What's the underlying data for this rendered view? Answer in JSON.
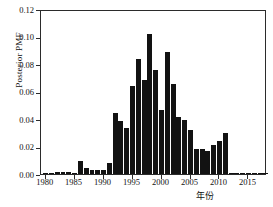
{
  "chart_data": {
    "type": "bar",
    "title": "",
    "xlabel": "年份",
    "ylabel": "Posterior PMF",
    "ylim": [
      0.0,
      0.12
    ],
    "xlim": [
      1979.2,
      2018.2
    ],
    "grid": false,
    "legend": null,
    "bar_color": "#121212",
    "background_color": "#ffffff",
    "axis_color": "#2b2b2b",
    "ytick_labels": [
      "0.00",
      "0.02",
      "0.04",
      "0.06",
      "0.08",
      "0.10",
      "0.12"
    ],
    "ytick_values": [
      0.0,
      0.02,
      0.04,
      0.06,
      0.08,
      0.1,
      0.12
    ],
    "xtick_labels": [
      "1980",
      "1985",
      "1990",
      "1995",
      "2000",
      "2005",
      "2010",
      "2015"
    ],
    "xtick_values": [
      1980,
      1985,
      1990,
      1995,
      2000,
      2005,
      2010,
      2015
    ],
    "categories": [
      1980,
      1981,
      1982,
      1983,
      1984,
      1985,
      1986,
      1987,
      1988,
      1989,
      1990,
      1991,
      1992,
      1993,
      1994,
      1995,
      1996,
      1997,
      1998,
      1999,
      2000,
      2001,
      2002,
      2003,
      2004,
      2005,
      2006,
      2007,
      2008,
      2009,
      2010,
      2011,
      2012,
      2013,
      2014,
      2015,
      2016,
      2017,
      2018
    ],
    "values": [
      0.0005,
      0.0008,
      0.0015,
      0.0018,
      0.0018,
      0.001,
      0.0092,
      0.0042,
      0.003,
      0.003,
      0.003,
      0.0078,
      0.0447,
      0.0382,
      0.0335,
      0.0638,
      0.0836,
      0.0686,
      0.102,
      0.0754,
      0.0468,
      0.0884,
      0.0658,
      0.0412,
      0.0396,
      0.032,
      0.0185,
      0.0185,
      0.0168,
      0.0212,
      0.024,
      0.03,
      0.0008,
      0.0006,
      0.0005,
      0.0005,
      0.0006,
      0.0005,
      0.0005
    ]
  }
}
